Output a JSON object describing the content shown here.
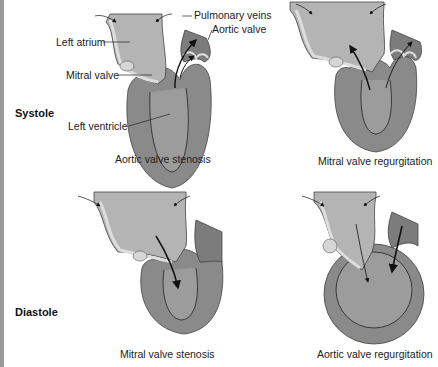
{
  "rows": {
    "top": "Systole",
    "bottom": "Diastole"
  },
  "panels": [
    {
      "caption": "Aortic valve stenosis"
    },
    {
      "caption": "Mitral valve regurgitation"
    },
    {
      "caption": "Mitral valve stenosis"
    },
    {
      "caption": "Aortic valve regurgitation"
    }
  ],
  "labels": {
    "pulmonary_veins": "Pulmonary veins",
    "aortic_valve": "Aortic valve",
    "left_atrium": "Left atrium",
    "mitral_valve": "Mitral valve",
    "left_ventricle": "Left ventricle"
  },
  "colors": {
    "atrium": "#b4b4b4",
    "ventricle_wall": "#8a8a8a",
    "ventricle_cavity": "#9c9c9c",
    "valve_tissue": "#d6d6d6",
    "outline": "#333333"
  }
}
